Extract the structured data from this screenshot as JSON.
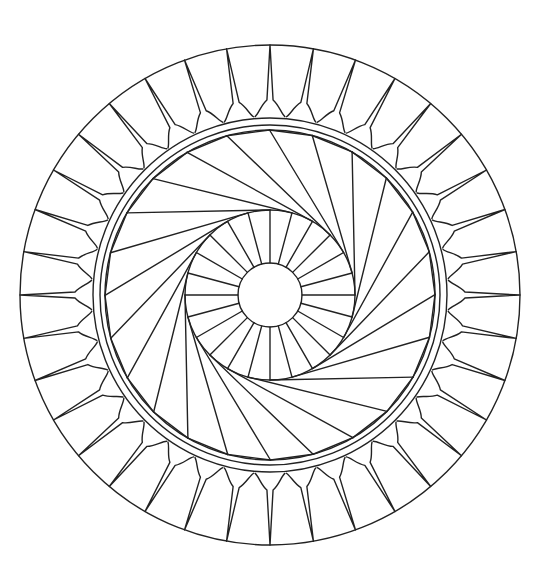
{
  "artwork": {
    "kind": "mandala-coloring-page",
    "background": "#ffffff",
    "stroke": "#222222",
    "center": [
      270,
      295
    ],
    "outer_radius": 250,
    "petal_ring": {
      "count": 36,
      "inner_radius": 177
    },
    "band_rings": [
      177,
      170,
      165
    ],
    "swirl": {
      "blades": 24,
      "inner_radius": 85,
      "outer_radius": 165
    },
    "hub_spokes": {
      "count": 24,
      "inner_radius": 32,
      "outer_radius": 85
    },
    "center_circle_radius": 32
  }
}
